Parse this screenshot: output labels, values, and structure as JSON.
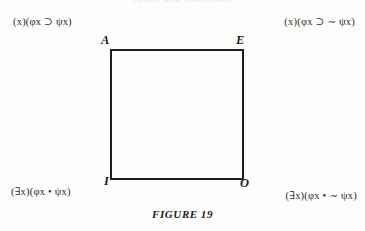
{
  "page": {
    "running_header": "LOGIC AND LANGUAGE",
    "background_color": "#fdfdfc",
    "ink_color": "#1d1d1d"
  },
  "figure": {
    "caption_label": "FIGURE",
    "caption_number": "19",
    "shape": "square-of-opposition",
    "border_color": "#1d1d1d",
    "border_width_px": 2.5
  },
  "vertices": {
    "top_left": "A",
    "top_right": "E",
    "bottom_left": "I",
    "bottom_right": "O"
  },
  "formulas": {
    "a": {
      "label": "A",
      "text": "(x)(φx ⊃ ψx)",
      "quantifier": "(x)",
      "matrix": "(φx ⊃ ψx)",
      "position": "top-left"
    },
    "e": {
      "label": "E",
      "text": "(x)(φx ⊃ ∼ ψx)",
      "quantifier": "(x)",
      "matrix": "(φx ⊃ ∼ ψx)",
      "position": "top-right"
    },
    "i": {
      "label": "I",
      "text": "(∃x)(φx • ψx)",
      "quantifier": "(∃x)",
      "matrix": "(φx • ψx)",
      "position": "bottom-left"
    },
    "o": {
      "label": "O",
      "text": "(∃x)(φx • ∼ ψx)",
      "quantifier": "(∃x)",
      "matrix": "(φx • ∼ ψx)",
      "position": "bottom-right"
    }
  }
}
